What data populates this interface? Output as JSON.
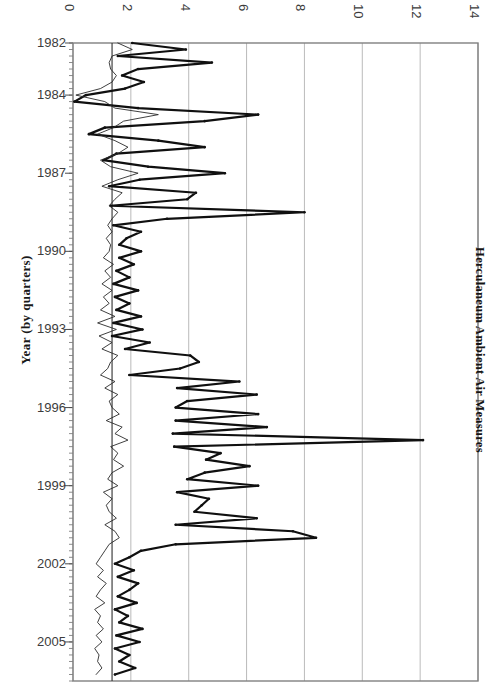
{
  "chart_data": {
    "type": "line",
    "title": "Herculaneum Ambient Air Measures",
    "xlabel": "",
    "ylabel": "Year (by quarters)",
    "orientation": "horizontal-value-axis-top",
    "grid": true,
    "legend": "none",
    "xlim": [
      0,
      14
    ],
    "xticks": [
      0,
      2,
      4,
      6,
      8,
      10,
      12,
      14
    ],
    "xtick_labels": [
      "0",
      "2",
      "4",
      "6",
      "8",
      "10",
      "12",
      "14"
    ],
    "ylim": [
      1982.0,
      2006.5
    ],
    "yticks": [
      1982,
      1984,
      1987,
      1990,
      1993,
      1996,
      1999,
      2002,
      2005
    ],
    "ytick_labels": [
      "1982",
      "1984",
      "1987",
      "1990",
      "1993",
      "1996",
      "1999",
      "2002",
      "2005"
    ],
    "y_minor_tick_interval": 0.25,
    "reference_line_x": 1.35,
    "series": [
      {
        "name": "thick-series",
        "style": "thick",
        "color": "#101010",
        "linewidth": 2.2,
        "markers": true,
        "y": [
          1982.0,
          1982.25,
          1982.5,
          1982.75,
          1983.0,
          1983.25,
          1983.5,
          1983.75,
          1984.0,
          1984.25,
          1984.5,
          1984.75,
          1985.0,
          1985.25,
          1985.5,
          1985.75,
          1986.0,
          1986.25,
          1986.5,
          1986.75,
          1987.0,
          1987.25,
          1987.5,
          1987.75,
          1988.0,
          1988.25,
          1988.5,
          1988.75,
          1989.0,
          1989.25,
          1989.5,
          1989.75,
          1990.0,
          1990.25,
          1990.5,
          1990.75,
          1991.0,
          1991.25,
          1991.5,
          1991.75,
          1992.0,
          1992.25,
          1992.5,
          1992.75,
          1993.0,
          1993.25,
          1993.5,
          1993.75,
          1994.0,
          1994.25,
          1994.5,
          1994.75,
          1995.0,
          1995.25,
          1995.5,
          1995.75,
          1996.0,
          1996.25,
          1996.5,
          1996.75,
          1997.0,
          1997.25,
          1997.5,
          1997.75,
          1998.0,
          1998.25,
          1998.5,
          1998.75,
          1999.0,
          1999.25,
          1999.5,
          1999.75,
          2000.0,
          2000.25,
          2000.5,
          2000.75,
          2001.0,
          2001.25,
          2001.5,
          2001.75,
          2002.0,
          2002.25,
          2002.5,
          2002.75,
          2003.0,
          2003.25,
          2003.5,
          2003.75,
          2004.0,
          2004.25,
          2004.5,
          2004.75,
          2005.0,
          2005.25,
          2005.5,
          2005.75,
          2006.0,
          2006.25
        ],
        "x": [
          2.05,
          3.9,
          1.55,
          4.8,
          2.25,
          1.7,
          2.45,
          1.8,
          0.45,
          0.05,
          2.25,
          6.4,
          4.55,
          1.1,
          0.55,
          2.95,
          4.55,
          1.5,
          1.05,
          2.6,
          5.25,
          2.3,
          1.25,
          4.25,
          3.95,
          1.3,
          8.0,
          3.25,
          1.4,
          2.35,
          1.85,
          1.6,
          2.35,
          1.6,
          2.1,
          1.5,
          1.95,
          1.4,
          2.25,
          1.45,
          1.95,
          1.5,
          2.35,
          1.4,
          2.4,
          1.35,
          2.65,
          1.8,
          4.05,
          4.35,
          3.7,
          1.95,
          5.75,
          3.6,
          6.35,
          3.95,
          3.55,
          6.4,
          3.55,
          6.7,
          3.45,
          12.1,
          3.5,
          5.1,
          4.6,
          6.1,
          4.55,
          3.95,
          6.4,
          3.6,
          4.7,
          4.45,
          4.2,
          6.35,
          3.55,
          7.6,
          8.4,
          3.55,
          2.35,
          1.95,
          1.45,
          2.1,
          1.55,
          2.25,
          1.95,
          1.55,
          2.2,
          1.45,
          1.9,
          1.6,
          2.4,
          1.5,
          2.3,
          1.45,
          1.95,
          1.6,
          2.15,
          1.45
        ],
        "description": "Bold series with large quarterly swings, peaking near 12 around 1997 and near 8.4 around 2001"
      },
      {
        "name": "thin-series",
        "style": "thin",
        "color": "#2a2a2a",
        "linewidth": 0.9,
        "markers": false,
        "y": [
          1982.0,
          1982.25,
          1982.5,
          1982.75,
          1983.0,
          1983.25,
          1983.5,
          1983.75,
          1984.0,
          1984.25,
          1984.5,
          1984.75,
          1985.0,
          1985.25,
          1985.5,
          1985.75,
          1986.0,
          1986.25,
          1986.5,
          1986.75,
          1987.0,
          1987.25,
          1987.5,
          1987.75,
          1988.0,
          1988.25,
          1988.5,
          1988.75,
          1989.0,
          1989.25,
          1989.5,
          1989.75,
          1990.0,
          1990.25,
          1990.5,
          1990.75,
          1991.0,
          1991.25,
          1991.5,
          1991.75,
          1992.0,
          1992.25,
          1992.5,
          1992.75,
          1993.0,
          1993.25,
          1993.5,
          1993.75,
          1994.0,
          1994.25,
          1994.5,
          1994.75,
          1995.0,
          1995.25,
          1995.5,
          1995.75,
          1996.0,
          1996.25,
          1996.5,
          1996.75,
          1997.0,
          1997.25,
          1997.5,
          1997.75,
          1998.0,
          1998.25,
          1998.5,
          1998.75,
          1999.0,
          1999.25,
          1999.5,
          1999.75,
          2000.0,
          2000.25,
          2000.5,
          2000.75,
          2001.0,
          2001.25,
          2001.5,
          2001.75,
          2002.0,
          2002.25,
          2002.5,
          2002.75,
          2003.0,
          2003.25,
          2003.5,
          2003.75,
          2004.0,
          2004.25,
          2004.5,
          2004.75,
          2005.0,
          2005.25,
          2005.5,
          2005.75,
          2006.0,
          2006.25
        ],
        "x": [
          1.55,
          2.05,
          1.35,
          1.25,
          1.3,
          1.5,
          1.35,
          0.95,
          0.1,
          1.1,
          1.45,
          2.95,
          1.75,
          1.4,
          0.85,
          1.45,
          1.9,
          1.55,
          0.95,
          1.3,
          2.25,
          1.55,
          1.0,
          1.7,
          1.45,
          1.25,
          1.55,
          1.35,
          1.2,
          1.35,
          1.15,
          1.3,
          1.25,
          1.05,
          1.4,
          1.1,
          1.3,
          1.0,
          1.35,
          1.05,
          1.25,
          0.95,
          1.45,
          0.85,
          1.5,
          0.9,
          1.35,
          1.0,
          1.55,
          1.3,
          1.2,
          0.95,
          1.45,
          1.1,
          1.55,
          1.25,
          1.35,
          1.6,
          1.15,
          1.7,
          1.45,
          1.9,
          1.3,
          1.55,
          1.4,
          1.75,
          1.35,
          1.2,
          1.55,
          1.05,
          1.35,
          1.15,
          1.25,
          1.5,
          1.1,
          1.45,
          1.6,
          1.25,
          1.1,
          0.95,
          0.8,
          1.05,
          0.85,
          1.15,
          0.95,
          0.8,
          1.1,
          0.75,
          0.95,
          0.85,
          1.05,
          0.8,
          1.0,
          0.75,
          0.9,
          0.85,
          1.0,
          0.8
        ],
        "description": "Thin series staying mostly between 0.8 and 2.0, dipping near 0 in 1984"
      }
    ]
  },
  "axis": {
    "value_axis_position": "top",
    "category_axis_position": "left",
    "frame_color": "#808080",
    "grid_color": "#a8a8a8"
  }
}
